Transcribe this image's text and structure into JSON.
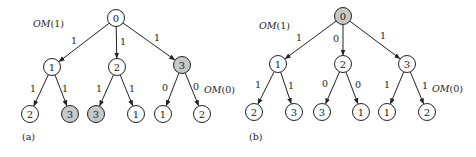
{
  "style": {
    "node_fill": "#ffffff",
    "highlight_fill": "#c8c8c8",
    "stroke": "#222222",
    "node_radius": 8.5
  },
  "panels": [
    {
      "id": "a",
      "label": "(a)",
      "label_pos": [
        22,
        140
      ],
      "om_labels": [
        {
          "text_italic": "OM",
          "text": "(1)",
          "x": 33,
          "y": 27
        },
        {
          "text_italic": "OM",
          "text": "(0)",
          "x": 204,
          "y": 93
        }
      ],
      "nodes": [
        {
          "id": "r",
          "label": "0",
          "x": 116,
          "y": 18,
          "highlight": false
        },
        {
          "id": "n1",
          "label": "1",
          "x": 52,
          "y": 67,
          "highlight": false
        },
        {
          "id": "n2",
          "label": "2",
          "x": 117,
          "y": 67,
          "highlight": false
        },
        {
          "id": "n3",
          "label": "3",
          "x": 182,
          "y": 65,
          "highlight": true
        },
        {
          "id": "l1",
          "label": "2",
          "x": 30,
          "y": 114,
          "highlight": false
        },
        {
          "id": "l2",
          "label": "3",
          "x": 70,
          "y": 114,
          "highlight": true
        },
        {
          "id": "l3",
          "label": "3",
          "x": 96,
          "y": 114,
          "highlight": true
        },
        {
          "id": "l4",
          "label": "1",
          "x": 136,
          "y": 114,
          "highlight": false
        },
        {
          "id": "l5",
          "label": "1",
          "x": 163,
          "y": 114,
          "highlight": false
        },
        {
          "id": "l6",
          "label": "2",
          "x": 202,
          "y": 114,
          "highlight": false
        }
      ],
      "edges": [
        {
          "from": "r",
          "to": "n1",
          "label": "1",
          "lx": 74,
          "ly": 40
        },
        {
          "from": "r",
          "to": "n2",
          "label": "1",
          "lx": 123,
          "ly": 41
        },
        {
          "from": "r",
          "to": "n3",
          "label": "1",
          "lx": 157,
          "ly": 37
        },
        {
          "from": "n1",
          "to": "l1",
          "label": "1",
          "lx": 33,
          "ly": 88
        },
        {
          "from": "n1",
          "to": "l2",
          "label": "1",
          "lx": 65,
          "ly": 88
        },
        {
          "from": "n2",
          "to": "l3",
          "label": "1",
          "lx": 99,
          "ly": 88
        },
        {
          "from": "n2",
          "to": "l4",
          "label": "1",
          "lx": 132,
          "ly": 88
        },
        {
          "from": "n3",
          "to": "l5",
          "label": "0",
          "lx": 165,
          "ly": 87
        },
        {
          "from": "n3",
          "to": "l6",
          "label": "0",
          "lx": 196,
          "ly": 86
        }
      ]
    },
    {
      "id": "b",
      "label": "(b)",
      "label_pos": [
        249,
        140
      ],
      "om_labels": [
        {
          "text_italic": "OM",
          "text": "(1)",
          "x": 259,
          "y": 29
        },
        {
          "text_italic": "OM",
          "text": "(0)",
          "x": 432,
          "y": 92
        }
      ],
      "nodes": [
        {
          "id": "r",
          "label": "0",
          "x": 343,
          "y": 16,
          "highlight": true
        },
        {
          "id": "n1",
          "label": "1",
          "x": 278,
          "y": 64,
          "highlight": false
        },
        {
          "id": "n2",
          "label": "2",
          "x": 343,
          "y": 64,
          "highlight": false
        },
        {
          "id": "n3",
          "label": "3",
          "x": 407,
          "y": 64,
          "highlight": false
        },
        {
          "id": "l1",
          "label": "2",
          "x": 254,
          "y": 112,
          "highlight": false
        },
        {
          "id": "l2",
          "label": "3",
          "x": 294,
          "y": 112,
          "highlight": false
        },
        {
          "id": "l3",
          "label": "3",
          "x": 322,
          "y": 112,
          "highlight": false
        },
        {
          "id": "l4",
          "label": "1",
          "x": 361,
          "y": 112,
          "highlight": false
        },
        {
          "id": "l5",
          "label": "1",
          "x": 387,
          "y": 112,
          "highlight": false
        },
        {
          "id": "l6",
          "label": "2",
          "x": 427,
          "y": 112,
          "highlight": false
        }
      ],
      "edges": [
        {
          "from": "r",
          "to": "n1",
          "label": "1",
          "lx": 299,
          "ly": 37
        },
        {
          "from": "r",
          "to": "n2",
          "label": "0",
          "lx": 336,
          "ly": 38
        },
        {
          "from": "r",
          "to": "n3",
          "label": "1",
          "lx": 383,
          "ly": 35
        },
        {
          "from": "n1",
          "to": "l1",
          "label": "1",
          "lx": 258,
          "ly": 84
        },
        {
          "from": "n1",
          "to": "l2",
          "label": "1",
          "lx": 291,
          "ly": 85
        },
        {
          "from": "n2",
          "to": "l3",
          "label": "0",
          "lx": 325,
          "ly": 83
        },
        {
          "from": "n2",
          "to": "l4",
          "label": "0",
          "lx": 358,
          "ly": 84
        },
        {
          "from": "n3",
          "to": "l5",
          "label": "1",
          "lx": 387,
          "ly": 84
        },
        {
          "from": "n3",
          "to": "l6",
          "label": "1",
          "lx": 425,
          "ly": 85
        }
      ]
    }
  ]
}
